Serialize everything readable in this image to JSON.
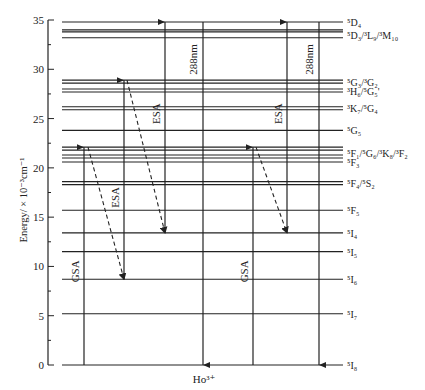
{
  "figure": {
    "ion_label": "Ho³⁺",
    "y_axis": {
      "title": "Energy/ × 10⁻³cm⁻¹",
      "min": 0,
      "max": 35,
      "ticks": [
        "0",
        "5",
        "10",
        "15",
        "20",
        "25",
        "30",
        "35"
      ],
      "minor_step": 2.5
    },
    "levels": [
      {
        "label": "⁵D₄",
        "energy": 34.8,
        "lines": [
          34.8
        ]
      },
      {
        "label": "⁵D₃/³L₉/³M₁₀",
        "energy": 33.5,
        "lines": [
          34.0,
          33.8,
          33.2
        ]
      },
      {
        "label": "⁵G₃/³G₂",
        "energy": 28.7,
        "lines": [
          28.9,
          28.6
        ]
      },
      {
        "label": "³H₆/⁵G₅'",
        "energy": 27.8,
        "lines": [
          28.0,
          27.7
        ]
      },
      {
        "label": "³K₇/⁵G₄",
        "energy": 26.1,
        "lines": [
          26.2,
          25.9
        ]
      },
      {
        "label": "⁵G₅",
        "energy": 23.8,
        "lines": [
          23.8
        ]
      },
      {
        "label": "⁵F₁/⁵G₆/³K₈/³F₂",
        "energy": 21.5,
        "lines": [
          22.1,
          21.8,
          21.3,
          21.0
        ]
      },
      {
        "label": "⁵F₃",
        "energy": 20.6,
        "lines": [
          20.6
        ]
      },
      {
        "label": "⁵F₄/⁵S₂",
        "energy": 18.5,
        "lines": [
          18.6,
          18.3
        ]
      },
      {
        "label": "⁵F₅",
        "energy": 15.7,
        "lines": [
          15.7
        ]
      },
      {
        "label": "⁵I₄",
        "energy": 13.4,
        "lines": [
          13.4
        ]
      },
      {
        "label": "⁵I₅",
        "energy": 11.5,
        "lines": [
          11.5
        ]
      },
      {
        "label": "⁵I₆",
        "energy": 8.7,
        "lines": [
          8.7
        ]
      },
      {
        "label": "⁵I₇",
        "energy": 5.2,
        "lines": [
          5.2
        ]
      },
      {
        "label": "⁵I₈",
        "energy": 0,
        "lines": [
          0
        ]
      }
    ],
    "transitions": [
      {
        "label": "GSA",
        "type": "solid-up",
        "x": 84,
        "from": 0,
        "to": 22.1
      },
      {
        "label": "",
        "type": "dashed",
        "x1": 88,
        "from": 22.1,
        "x2": 124,
        "to": 8.7
      },
      {
        "label": "ESA",
        "type": "solid-up",
        "x": 124,
        "from": 8.7,
        "to": 28.9
      },
      {
        "label": "",
        "type": "dashed",
        "x1": 127,
        "from": 28.9,
        "x2": 165,
        "to": 13.4
      },
      {
        "label": "ESA",
        "type": "solid-up",
        "x": 165,
        "from": 13.4,
        "to": 34.8
      },
      {
        "label": "288nm",
        "type": "solid-down",
        "x": 203,
        "from": 34.8,
        "to": 0
      },
      {
        "label": "GSA",
        "type": "solid-up",
        "x": 253,
        "from": 0,
        "to": 22.1
      },
      {
        "label": "",
        "type": "dashed",
        "x1": 256,
        "from": 22.1,
        "x2": 287,
        "to": 13.4
      },
      {
        "label": "ESA",
        "type": "solid-up",
        "x": 287,
        "from": 13.4,
        "to": 34.8
      },
      {
        "label": "288nm",
        "type": "solid-down",
        "x": 319,
        "from": 34.8,
        "to": 0
      }
    ]
  }
}
